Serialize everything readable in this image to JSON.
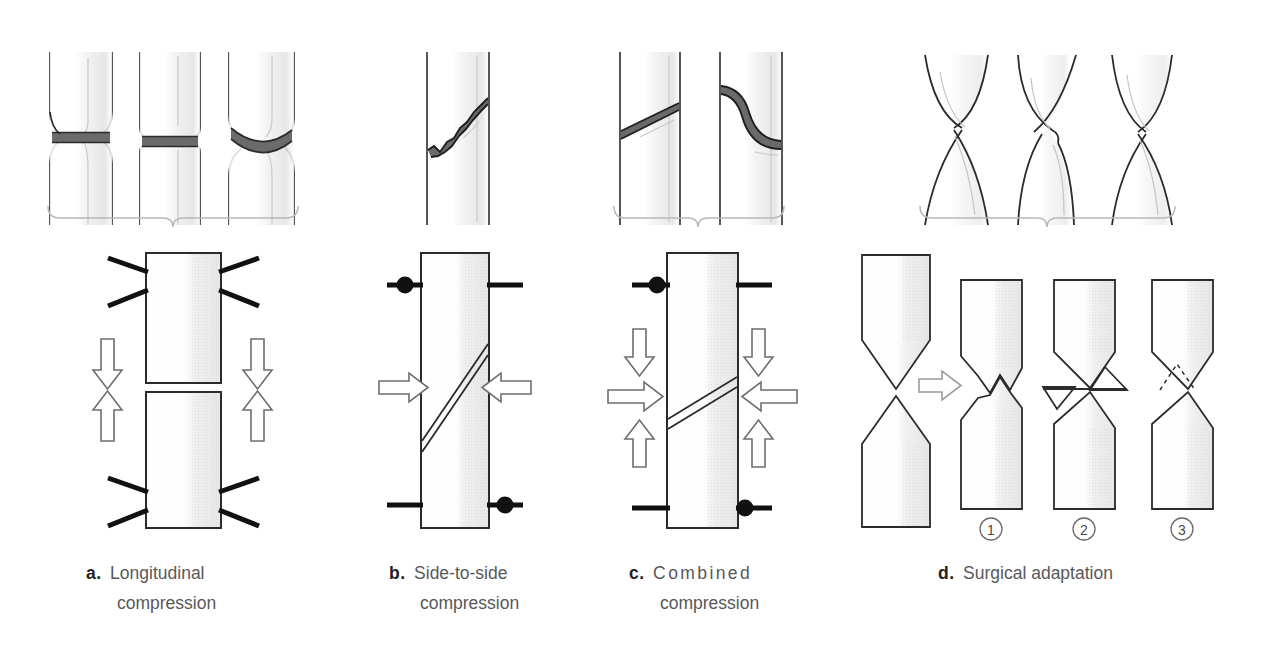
{
  "figure": {
    "background_color": "#ffffff",
    "line_color": "#2b2b2b",
    "shade_color": "#ebebeb",
    "ghost_color": "#c8c8c8",
    "brace_color": "#b4b4b4",
    "caption_text_color": "#58585a",
    "caption_letter_color": "#222222"
  },
  "panels": [
    {
      "id": "a",
      "letter": "a",
      "dot": ".",
      "caption_line1": "Longitudinal",
      "caption_line2": "compression",
      "letter_spacing": "normal",
      "top_label": "three transverse fracture bone illustrations",
      "bottom_label": "two stacked blocks with four compression arrows",
      "arrow_count": 4,
      "arrow_directions": [
        "down",
        "down",
        "up",
        "up"
      ],
      "brace": {
        "x_start": 48,
        "x_end": 298,
        "y": 205
      }
    },
    {
      "id": "b",
      "letter": "b",
      "dot": ".",
      "caption_line1": "Side-to-side",
      "caption_line2": "compression",
      "letter_spacing": "normal",
      "top_label": "single oblique fracture bone illustration",
      "bottom_label": "single block with oblique fracture line and two horizontal arrows",
      "arrow_count": 2,
      "arrow_directions": [
        "right",
        "left"
      ],
      "pin_count": 2,
      "brace": null
    },
    {
      "id": "c",
      "letter": "c",
      "dot": ".",
      "caption_line1": "Combined",
      "caption_line2": "compression",
      "letter_spacing": "wide",
      "top_label": "two oblique fracture bone illustrations",
      "bottom_label": "single block with oblique fracture line and six arrows",
      "arrow_count": 6,
      "arrow_directions": [
        "down",
        "right",
        "up",
        "down",
        "left",
        "up"
      ],
      "pin_count": 2,
      "brace": {
        "x_start": 614,
        "x_end": 784,
        "y": 205
      }
    },
    {
      "id": "d",
      "letter": "d",
      "dot": ".",
      "caption_line1": "Surgical adaptation",
      "caption_line2": "",
      "letter_spacing": "normal",
      "top_label": "three hourglass shaped bone end illustrations",
      "bottom_label": "pointed bone ends transformed into three adapted variants",
      "brace": {
        "x_start": 920,
        "x_end": 1175,
        "y": 205
      },
      "sub_items": [
        {
          "number": "①",
          "name": "notched-interlock"
        },
        {
          "number": "②",
          "name": "resected-wedges"
        },
        {
          "number": "③",
          "name": "flattened-contact"
        }
      ]
    }
  ]
}
